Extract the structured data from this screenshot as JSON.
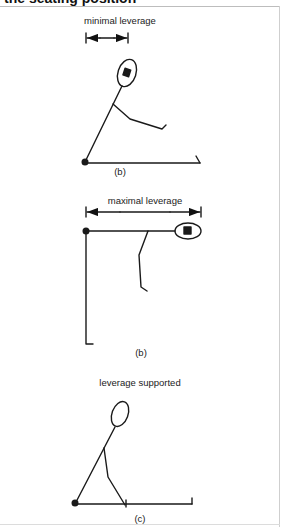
{
  "header": {
    "title": "the seating position"
  },
  "figures": [
    {
      "id": "a",
      "annotation": "minimal leverage",
      "caption": "(a)"
    },
    {
      "id": "b",
      "annotation": "maximal leverage",
      "caption": "(b)"
    },
    {
      "id": "c",
      "annotation": "leverage supported",
      "caption": "(c)"
    }
  ]
}
